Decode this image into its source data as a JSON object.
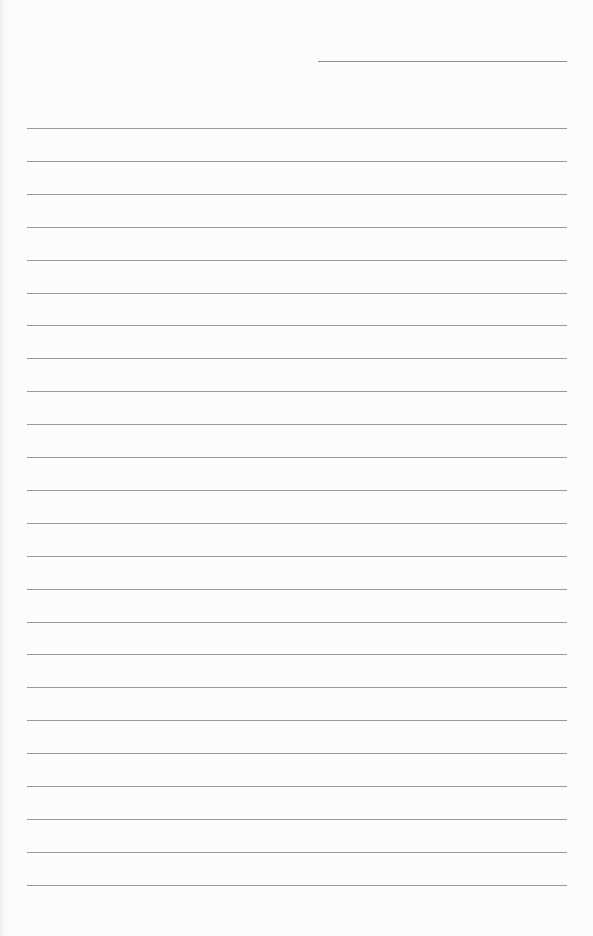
{
  "document": {
    "type": "lined-paper",
    "header_line": {
      "present": true
    },
    "ruled_lines": {
      "count": 24,
      "first_y": 128,
      "spacing": 32.9
    },
    "line_color": "#9a9a9a",
    "paper_color": "#fcfcfc"
  }
}
